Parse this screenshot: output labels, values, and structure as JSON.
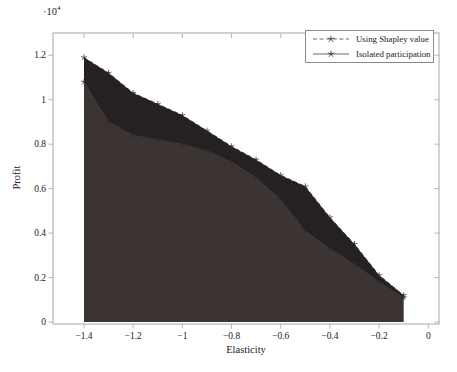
{
  "figure": {
    "y_axis_multiplier_base": "·10",
    "y_axis_multiplier_exp": "4",
    "ylabel": "Profit",
    "xlabel": "Elasticity"
  },
  "legend": {
    "items": [
      {
        "label": "Using Shapley value",
        "line_style": "dashed",
        "marker": "star"
      },
      {
        "label": "Isolated participation",
        "line_style": "solid",
        "marker": "star"
      }
    ]
  },
  "chart_data": {
    "type": "area",
    "title": "",
    "xlabel": "Elasticity",
    "ylabel": "Profit",
    "y_unit": "×10^4",
    "xlim": [
      -1.525,
      0.045
    ],
    "ylim": [
      0,
      1.3
    ],
    "grid": false,
    "legend_position": "top-right-inside",
    "x": [
      -1.4,
      -1.3,
      -1.2,
      -1.1,
      -1.0,
      -0.9,
      -0.8,
      -0.7,
      -0.6,
      -0.5,
      -0.4,
      -0.3,
      -0.2,
      -0.1
    ],
    "series": [
      {
        "name": "Using Shapley value",
        "values": [
          1.19,
          1.12,
          1.03,
          0.98,
          0.93,
          0.86,
          0.79,
          0.73,
          0.66,
          0.61,
          0.47,
          0.35,
          0.21,
          0.12
        ]
      },
      {
        "name": "Isolated participation",
        "values": [
          1.08,
          0.9,
          0.84,
          0.82,
          0.8,
          0.77,
          0.72,
          0.65,
          0.55,
          0.41,
          0.33,
          0.26,
          0.18,
          0.11
        ]
      }
    ],
    "xticks": [
      {
        "v": -1.4,
        "label": "−1.4"
      },
      {
        "v": -1.2,
        "label": "−1.2"
      },
      {
        "v": -1.0,
        "label": "−1"
      },
      {
        "v": -0.8,
        "label": "−0.8"
      },
      {
        "v": -0.6,
        "label": "−0.6"
      },
      {
        "v": -0.4,
        "label": "−0.4"
      },
      {
        "v": -0.2,
        "label": "−0.2"
      },
      {
        "v": 0.0,
        "label": "0"
      }
    ],
    "yticks": [
      {
        "v": 0.0,
        "label": "0"
      },
      {
        "v": 0.2,
        "label": "0.2"
      },
      {
        "v": 0.4,
        "label": "0.4"
      },
      {
        "v": 0.6,
        "label": "0.6"
      },
      {
        "v": 0.8,
        "label": "0.8"
      },
      {
        "v": 1.0,
        "label": "1"
      },
      {
        "v": 1.2,
        "label": "1.2"
      }
    ],
    "colors": {
      "isolated_fill": "#3c3333",
      "overlap_fill": "#252021",
      "line": "#2e2a2a",
      "axis": "#a6a6a6",
      "text": "#1a1a1a"
    }
  }
}
